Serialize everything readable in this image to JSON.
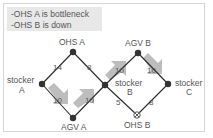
{
  "note": {
    "lines": [
      "-OHS A is bottleneck",
      "-OHS B is down"
    ]
  },
  "nodes": {
    "ohs_a": {
      "label": "OHS A",
      "status": "bottleneck"
    },
    "stocker_a": {
      "label_line1": "stocker",
      "label_line2": "A"
    },
    "agv_a": {
      "label": "AGV A"
    },
    "stocker_b": {
      "label_line1": "stocker",
      "label_line2": "B"
    },
    "agv_b": {
      "label": "AGV B"
    },
    "stocker_c": {
      "label_line1": "stocker",
      "label_line2": "C"
    },
    "ohs_b": {
      "label": "OHS B",
      "status": "down"
    }
  },
  "edges": {
    "stocker_a_ohs_a": {
      "weight": "14"
    },
    "ohs_a_stocker_b": {
      "weight": "8"
    },
    "stocker_a_agv_a": {
      "weight": "10",
      "flow_arrow": true
    },
    "agv_a_stocker_b": {
      "weight": "10",
      "flow_arrow": true
    },
    "stocker_b_agv_b": {
      "weight": "10",
      "flow_arrow": true
    },
    "agv_b_stocker_c": {
      "weight": "10",
      "flow_arrow": true
    },
    "stocker_b_ohs_b": {
      "weight": "5"
    },
    "ohs_b_stocker_c": {
      "weight": "8"
    }
  },
  "colors": {
    "node": "#333333",
    "edge": "#2a2a2a",
    "flow_arrow": "#bdbdbd",
    "note_bg": "#e8e8e8",
    "text": "#555555"
  }
}
